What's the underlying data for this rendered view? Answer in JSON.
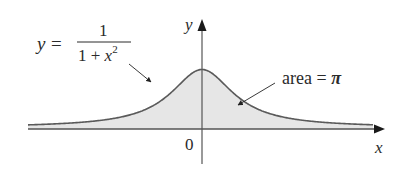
{
  "figure": {
    "function_label": {
      "lhs": "y",
      "equals": "=",
      "numerator": "1",
      "denominator_prefix": "1 + ",
      "denominator_var": "x",
      "denominator_exp": "2"
    },
    "area_label": {
      "text": "area = ",
      "symbol": "π"
    },
    "axes": {
      "x_label": "x",
      "y_label": "y",
      "origin_label": "0"
    },
    "colors": {
      "curve": "#5a5a5a",
      "fill": "#e6e6e6",
      "axis": "#555555",
      "text": "#2a2a2a"
    }
  },
  "chart_data": {
    "type": "area",
    "title": "",
    "function": "y = 1/(1+x^2)",
    "annotation": "area = π",
    "xlabel": "x",
    "ylabel": "y",
    "origin": "0",
    "x": [
      -6,
      -5,
      -4,
      -3,
      -2,
      -1.5,
      -1,
      -0.5,
      0,
      0.5,
      1,
      1.5,
      2,
      3,
      4,
      5,
      6
    ],
    "values": [
      0.027,
      0.038,
      0.059,
      0.1,
      0.2,
      0.308,
      0.5,
      0.8,
      1,
      0.8,
      0.5,
      0.308,
      0.2,
      0.1,
      0.059,
      0.038,
      0.027
    ],
    "grid": false,
    "legend": "none"
  }
}
